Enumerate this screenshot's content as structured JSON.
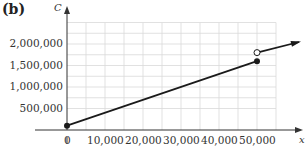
{
  "panel_label": "(b)",
  "chart_data": {
    "type": "line",
    "title": "",
    "xlabel": "x",
    "ylabel": "C",
    "xlim": [
      0,
      55000
    ],
    "ylim": [
      0,
      2500000
    ],
    "grid": true,
    "x_ticks": [
      "0",
      "10,000",
      "20,000",
      "30,000",
      "40,000",
      "50,000"
    ],
    "y_ticks": [
      "500,000",
      "1,000,000",
      "1,500,000",
      "2,000,000"
    ],
    "series": [
      {
        "name": "segment 1",
        "x": [
          0,
          50000
        ],
        "y": [
          100000,
          1600000
        ],
        "start_marker": "filled",
        "end_marker": "filled"
      },
      {
        "name": "segment 2",
        "x": [
          50000,
          60000
        ],
        "y": [
          1800000,
          2100000
        ],
        "start_marker": "open",
        "end_marker": "arrow"
      }
    ],
    "colors": {
      "line": "#1a1a1a",
      "grid": "#d9d9d9",
      "axis": "#333333"
    }
  }
}
